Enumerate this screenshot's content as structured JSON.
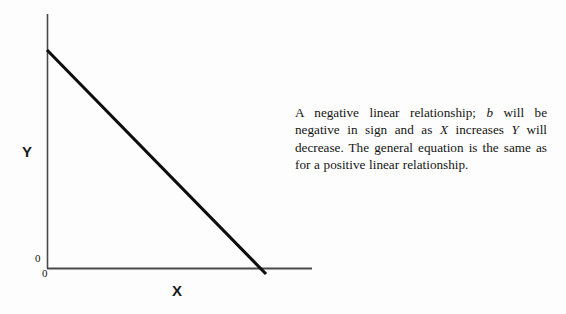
{
  "figure": {
    "caption_runs": [
      {
        "text": "A negative linear relationship; ",
        "italic": false
      },
      {
        "text": "b",
        "italic": true
      },
      {
        "text": " will be negative in sign and as ",
        "italic": false
      },
      {
        "text": "X",
        "italic": true
      },
      {
        "text": " increases ",
        "italic": false
      },
      {
        "text": "Y",
        "italic": true
      },
      {
        "text": " will decrease.  The general equation is the same as for a positive linear relationship.",
        "italic": false
      }
    ],
    "caption_plain": "A negative linear relationship; b will be negative in sign and as X increases Y will decrease. The general equation is the same as for a positive linear relationship."
  },
  "axes": {
    "y_title": "Y",
    "x_title": "X",
    "origin_label_y": "0",
    "origin_label_x": "0"
  },
  "colors": {
    "axis": "#4a4a4a",
    "data_line": "#0d0d0d",
    "text": "#141414",
    "background": "#fdfdfd"
  },
  "chart_data": {
    "type": "line",
    "title": "",
    "subtitle": "",
    "xlabel": "X",
    "ylabel": "Y",
    "xlim": [
      0,
      1
    ],
    "ylim": [
      0,
      1
    ],
    "grid": false,
    "legend": null,
    "annotations": [],
    "xtick_labels": [
      "0"
    ],
    "ytick_labels": [
      "0"
    ],
    "series": [
      {
        "name": "negative linear relationship",
        "slope_sign": "negative",
        "x": [
          0.0,
          1.0
        ],
        "y": [
          1.0,
          0.0
        ],
        "points_px": [
          [
            47,
            50
          ],
          [
            266,
            274
          ]
        ],
        "color": "#0d0d0d",
        "width_px": 3
      }
    ],
    "axis_geometry_px": {
      "y_axis": {
        "x": 47,
        "y_top": 14,
        "y_bottom": 268
      },
      "x_axis": {
        "y": 268,
        "x_left": 47,
        "x_right": 312
      }
    }
  }
}
